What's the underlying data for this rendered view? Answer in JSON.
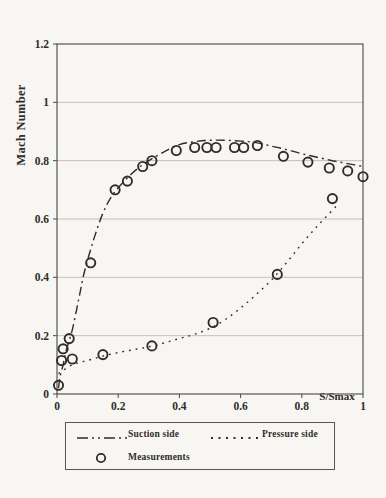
{
  "page": {
    "background": "#f7f6f2",
    "ink": "#2f2d2b",
    "grid_color": "#b5b2ad",
    "box_color": "#4a4846"
  },
  "chart_data": {
    "type": "line",
    "title": "",
    "xlabel": "S/Smax",
    "ylabel": "Mach Number",
    "xlim": [
      0,
      1
    ],
    "ylim": [
      0,
      1.2
    ],
    "x_tick_values": [
      0,
      0.2,
      0.4,
      0.6,
      0.8,
      1
    ],
    "x_tick_labels": [
      "0",
      "0.2",
      "0.4",
      "0.6",
      "0.8",
      "1"
    ],
    "y_tick_values": [
      0,
      0.2,
      0.4,
      0.6,
      0.8,
      1,
      1.2
    ],
    "y_tick_labels": [
      "0",
      "0.2",
      "0.4",
      "0.6",
      "0.8",
      "1",
      "1.2"
    ],
    "grid": "horizontal",
    "legend_position": "bottom",
    "series": [
      {
        "name": "Suction side",
        "type": "line",
        "dash": "dashdot",
        "points": [
          [
            0.005,
            0.02
          ],
          [
            0.01,
            0.06
          ],
          [
            0.02,
            0.1
          ],
          [
            0.03,
            0.15
          ],
          [
            0.05,
            0.22
          ],
          [
            0.07,
            0.32
          ],
          [
            0.09,
            0.42
          ],
          [
            0.12,
            0.53
          ],
          [
            0.15,
            0.62
          ],
          [
            0.18,
            0.68
          ],
          [
            0.22,
            0.73
          ],
          [
            0.26,
            0.77
          ],
          [
            0.3,
            0.8
          ],
          [
            0.35,
            0.83
          ],
          [
            0.4,
            0.855
          ],
          [
            0.45,
            0.865
          ],
          [
            0.5,
            0.87
          ],
          [
            0.55,
            0.87
          ],
          [
            0.6,
            0.867
          ],
          [
            0.65,
            0.862
          ],
          [
            0.7,
            0.85
          ],
          [
            0.75,
            0.838
          ],
          [
            0.8,
            0.824
          ],
          [
            0.85,
            0.812
          ],
          [
            0.9,
            0.8
          ],
          [
            0.95,
            0.79
          ],
          [
            1.0,
            0.78
          ]
        ]
      },
      {
        "name": "Pressure side",
        "type": "line",
        "dash": "dotted",
        "points": [
          [
            0.005,
            0.07
          ],
          [
            0.05,
            0.1
          ],
          [
            0.1,
            0.115
          ],
          [
            0.15,
            0.13
          ],
          [
            0.2,
            0.142
          ],
          [
            0.25,
            0.152
          ],
          [
            0.3,
            0.162
          ],
          [
            0.35,
            0.175
          ],
          [
            0.4,
            0.19
          ],
          [
            0.45,
            0.205
          ],
          [
            0.5,
            0.225
          ],
          [
            0.55,
            0.255
          ],
          [
            0.6,
            0.295
          ],
          [
            0.65,
            0.34
          ],
          [
            0.7,
            0.39
          ],
          [
            0.75,
            0.45
          ],
          [
            0.8,
            0.515
          ],
          [
            0.85,
            0.575
          ],
          [
            0.9,
            0.63
          ],
          [
            0.92,
            0.655
          ]
        ]
      },
      {
        "name": "Measurements",
        "type": "scatter",
        "marker": "circle",
        "points": [
          [
            0.005,
            0.03
          ],
          [
            0.015,
            0.115
          ],
          [
            0.02,
            0.155
          ],
          [
            0.04,
            0.19
          ],
          [
            0.05,
            0.12
          ],
          [
            0.11,
            0.45
          ],
          [
            0.15,
            0.135
          ],
          [
            0.19,
            0.7
          ],
          [
            0.23,
            0.73
          ],
          [
            0.28,
            0.78
          ],
          [
            0.31,
            0.165
          ],
          [
            0.31,
            0.8
          ],
          [
            0.39,
            0.835
          ],
          [
            0.45,
            0.845
          ],
          [
            0.49,
            0.845
          ],
          [
            0.51,
            0.245
          ],
          [
            0.52,
            0.845
          ],
          [
            0.58,
            0.845
          ],
          [
            0.61,
            0.845
          ],
          [
            0.655,
            0.852
          ],
          [
            0.72,
            0.41
          ],
          [
            0.74,
            0.815
          ],
          [
            0.82,
            0.795
          ],
          [
            0.89,
            0.775
          ],
          [
            0.9,
            0.67
          ],
          [
            0.95,
            0.765
          ],
          [
            1.0,
            0.745
          ]
        ]
      }
    ]
  }
}
